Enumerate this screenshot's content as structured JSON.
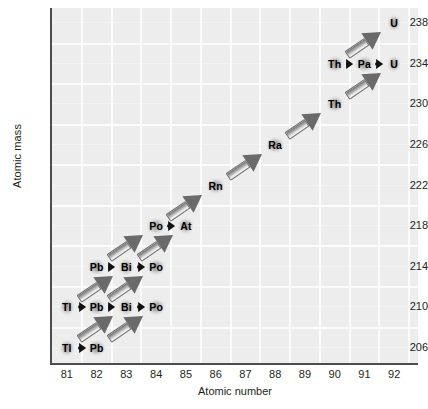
{
  "chart_data": {
    "type": "scatter",
    "title": "",
    "xlabel": "Atomic number",
    "ylabel": "Atomic mass",
    "xlim": [
      80.5,
      92.8
    ],
    "ylim": [
      204.5,
      239.5
    ],
    "xticks": [
      81,
      82,
      83,
      84,
      85,
      86,
      87,
      88,
      89,
      90,
      91,
      92
    ],
    "yticks": [
      206,
      210,
      214,
      218,
      222,
      226,
      230,
      234,
      238
    ],
    "grid": true,
    "legend": "none",
    "nodes": [
      {
        "label": "U",
        "z": 92,
        "a": 238
      },
      {
        "label": "Th",
        "z": 90,
        "a": 234
      },
      {
        "label": "Pa",
        "z": 91,
        "a": 234
      },
      {
        "label": "U",
        "z": 92,
        "a": 234
      },
      {
        "label": "Th",
        "z": 90,
        "a": 230
      },
      {
        "label": "Ra",
        "z": 88,
        "a": 226
      },
      {
        "label": "Rn",
        "z": 86,
        "a": 222
      },
      {
        "label": "Po",
        "z": 84,
        "a": 218
      },
      {
        "label": "At",
        "z": 85,
        "a": 218
      },
      {
        "label": "Pb",
        "z": 82,
        "a": 214
      },
      {
        "label": "Bi",
        "z": 83,
        "a": 214
      },
      {
        "label": "Po",
        "z": 84,
        "a": 214
      },
      {
        "label": "Tl",
        "z": 81,
        "a": 210
      },
      {
        "label": "Pb",
        "z": 82,
        "a": 210
      },
      {
        "label": "Bi",
        "z": 83,
        "a": 210
      },
      {
        "label": "Po",
        "z": 84,
        "a": 210
      },
      {
        "label": "Tl",
        "z": 81,
        "a": 206
      },
      {
        "label": "Pb",
        "z": 82,
        "a": 206
      }
    ],
    "beta_decays": [
      {
        "from_z": 90,
        "from_a": 234,
        "to_z": 91,
        "to_a": 234
      },
      {
        "from_z": 91,
        "from_a": 234,
        "to_z": 92,
        "to_a": 234
      },
      {
        "from_z": 84,
        "from_a": 218,
        "to_z": 85,
        "to_a": 218
      },
      {
        "from_z": 82,
        "from_a": 214,
        "to_z": 83,
        "to_a": 214
      },
      {
        "from_z": 83,
        "from_a": 214,
        "to_z": 84,
        "to_a": 214
      },
      {
        "from_z": 81,
        "from_a": 210,
        "to_z": 82,
        "to_a": 210
      },
      {
        "from_z": 82,
        "from_a": 210,
        "to_z": 83,
        "to_a": 210
      },
      {
        "from_z": 83,
        "from_a": 210,
        "to_z": 84,
        "to_a": 210
      },
      {
        "from_z": 81,
        "from_a": 206,
        "to_z": 82,
        "to_a": 206
      }
    ],
    "alpha_decays": [
      {
        "from_z": 92,
        "from_a": 238,
        "to_z": 90,
        "to_a": 234
      },
      {
        "from_z": 92,
        "from_a": 234,
        "to_z": 90,
        "to_a": 230
      },
      {
        "from_z": 90,
        "from_a": 230,
        "to_z": 88,
        "to_a": 226
      },
      {
        "from_z": 88,
        "from_a": 226,
        "to_z": 86,
        "to_a": 222
      },
      {
        "from_z": 86,
        "from_a": 222,
        "to_z": 84,
        "to_a": 218
      },
      {
        "from_z": 85,
        "from_a": 218,
        "to_z": 83,
        "to_a": 214
      },
      {
        "from_z": 84,
        "from_a": 218,
        "to_z": 82,
        "to_a": 214
      },
      {
        "from_z": 84,
        "from_a": 214,
        "to_z": 82,
        "to_a": 210
      },
      {
        "from_z": 83,
        "from_a": 214,
        "to_z": 81,
        "to_a": 210
      },
      {
        "from_z": 84,
        "from_a": 210,
        "to_z": 82,
        "to_a": 206
      },
      {
        "from_z": 83,
        "from_a": 210,
        "to_z": 81,
        "to_a": 206
      }
    ]
  },
  "colors": {
    "plot_background": "#ededed",
    "gridline": "#fbfbfb",
    "axis": "#4d4d4d",
    "text": "#231f20",
    "beta_arrow": "#111111",
    "alpha_arrow": "#8e8e8e"
  }
}
